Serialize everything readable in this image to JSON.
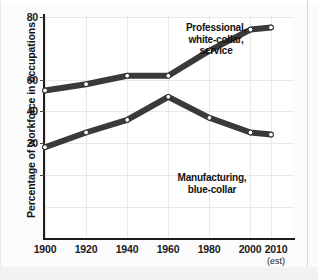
{
  "chart_data": {
    "type": "line",
    "title": "",
    "xlabel": "",
    "ylabel": "Percentage of workforce in occupations",
    "x": [
      1900,
      1920,
      1940,
      1960,
      1980,
      2000,
      2010
    ],
    "categories": [
      "1900",
      "1920",
      "1940",
      "1960",
      "1980",
      "2000",
      "2010"
    ],
    "xtick_labels": [
      "1900",
      "1920",
      "1940",
      "1960",
      "1980",
      "2000",
      "2010"
    ],
    "xtick_sublabel": "(est)",
    "ytick_labels": [
      "20",
      "40",
      "60",
      "80"
    ],
    "yticks": [
      20,
      40,
      60,
      80
    ],
    "ylim": [
      0,
      80
    ],
    "xlim": [
      1900,
      2010
    ],
    "grid": true,
    "legend_position": "inline-annotations",
    "series": [
      {
        "name": "Professional, white-collar, service",
        "label_lines": [
          "Professional,",
          "white-collar,",
          "service"
        ],
        "color": "#3a3a3a",
        "marker": "open-circle",
        "values": [
          45,
          48,
          52,
          52,
          64,
          74,
          75
        ]
      },
      {
        "name": "Manufacturing, blue-collar",
        "label_lines": [
          "Manufacturing,",
          "blue-collar"
        ],
        "color": "#3a3a3a",
        "marker": "open-circle",
        "values": [
          18,
          25,
          31,
          42,
          32,
          25,
          24
        ]
      }
    ],
    "annotations": [
      {
        "text": "Professional, white-collar, service",
        "series": 0
      },
      {
        "text": "Manufacturing, blue-collar",
        "series": 1
      }
    ]
  },
  "axes": {
    "y_title": "Percentage of workforce in occupations",
    "y_ticks": [
      {
        "value": 80,
        "label": "80"
      },
      {
        "value": 60,
        "label": "60"
      },
      {
        "value": 40,
        "label": "40"
      },
      {
        "value": 20,
        "label": "20"
      }
    ],
    "x_ticks": [
      {
        "value": 1900,
        "label": "1900"
      },
      {
        "value": 1920,
        "label": "1920"
      },
      {
        "value": 1940,
        "label": "1940"
      },
      {
        "value": 1960,
        "label": "1960"
      },
      {
        "value": 1980,
        "label": "1980"
      },
      {
        "value": 2000,
        "label": "2000"
      },
      {
        "value": 2010,
        "label": "2010"
      }
    ],
    "x_note": "(est)"
  },
  "labels": {
    "white_collar_line1": "Professional,",
    "white_collar_line2": "white-collar,",
    "white_collar_line3": "service",
    "blue_collar_line1": "Manufacturing,",
    "blue_collar_line2": "blue-collar"
  },
  "colors": {
    "line": "#3a3a3a",
    "axis": "#1c1c1c",
    "grid": "#e9e9e9",
    "text": "#111111",
    "background": "#ffffff"
  }
}
